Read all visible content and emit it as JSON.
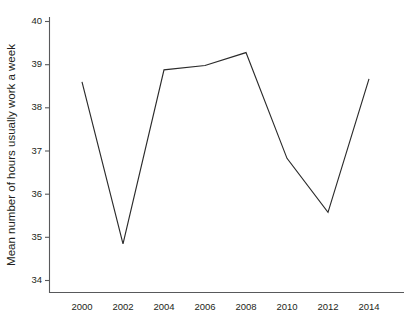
{
  "chart_data": {
    "type": "line",
    "title": "",
    "xlabel": "",
    "ylabel": "Mean number of hours usually work a week",
    "x": [
      2000,
      2002,
      2004,
      2006,
      2008,
      2010,
      2012,
      2014
    ],
    "xtick_labels": [
      "2000",
      "2002",
      "2004",
      "2006",
      "2008",
      "2010",
      "2012",
      "2014"
    ],
    "ytick_labels": [
      "34",
      "35",
      "36",
      "37",
      "38",
      "39",
      "40"
    ],
    "yticks": [
      34,
      35,
      36,
      37,
      38,
      39,
      40
    ],
    "xlim": [
      1999,
      2015
    ],
    "ylim": [
      33.7,
      40.2
    ],
    "grid": false,
    "legend": false,
    "series": [
      {
        "name": "Mean hours usually worked per week",
        "color": "#2b2b2b",
        "values": [
          38.6,
          34.85,
          38.88,
          38.98,
          39.28,
          36.83,
          35.58,
          38.67
        ]
      }
    ]
  },
  "axes": {
    "y_title": "Mean number of hours usually work a week",
    "x_title": ""
  }
}
